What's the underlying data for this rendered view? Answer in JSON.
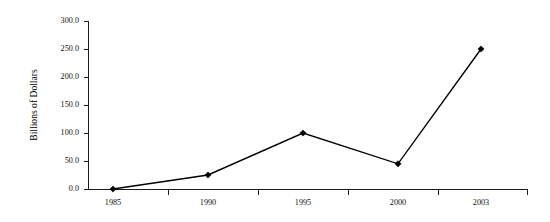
{
  "chart_data": {
    "type": "line",
    "title": "",
    "xlabel": "",
    "ylabel": "Billions of Dollars",
    "categories": [
      "1985",
      "1990",
      "1995",
      "2000",
      "2003"
    ],
    "values": [
      0.0,
      25.0,
      100.0,
      45.0,
      250.0
    ],
    "series": [
      {
        "name": "Billions of Dollars",
        "values": [
          0.0,
          25.0,
          100.0,
          45.0,
          250.0
        ]
      }
    ],
    "ylim": [
      0.0,
      300.0
    ],
    "ytick_values": [
      0.0,
      50.0,
      100.0,
      150.0,
      200.0,
      250.0,
      300.0
    ],
    "ytick_labels": [
      "0.0",
      "50.0",
      "100.0",
      "150.0",
      "200.0",
      "250.0",
      "300.0"
    ],
    "xtick_labels": [
      "1985",
      "1990",
      "1995",
      "2000",
      "2003"
    ],
    "grid": false,
    "legend": false,
    "legend_position": "none",
    "marker": "diamond",
    "line_color": "#000000",
    "marker_color": "#000000",
    "axis_color": "#1a1a1a",
    "background_color": "#ffffff"
  }
}
